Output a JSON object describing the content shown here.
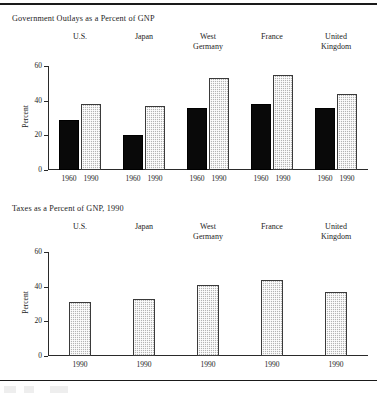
{
  "document": {
    "has_top_rule": true,
    "has_bottom_rule": true
  },
  "charts": [
    {
      "id": "government-outlays",
      "title": "Government Outlays as a Percent of GNP",
      "ylabel": "Percent",
      "yticks": [
        "60",
        "40",
        "20",
        "0"
      ],
      "groups": [
        "U.S.",
        "Japan",
        "West\nGermany",
        "France",
        "United\nKingdom"
      ],
      "xlabels": [
        "1960",
        "1990",
        "1960",
        "1990",
        "1960",
        "1990",
        "1960",
        "1990",
        "1960",
        "1990"
      ]
    },
    {
      "id": "taxes",
      "title": "Taxes as a Percent of GNP, 1990",
      "ylabel": "Percent",
      "yticks": [
        "60",
        "40",
        "20",
        "0"
      ],
      "groups": [
        "U.S.",
        "Japan",
        "West\nGermany",
        "France",
        "United\nKingdom"
      ],
      "xlabels": [
        "1990",
        "1990",
        "1990",
        "1990",
        "1990"
      ]
    }
  ],
  "chart_data": [
    {
      "type": "bar",
      "title": "Government Outlays as a Percent of GNP",
      "xlabel": "",
      "ylabel": "Percent",
      "ylim": [
        0,
        60
      ],
      "yticks": [
        0,
        20,
        40,
        60
      ],
      "grid": false,
      "legend": "none",
      "categories": [
        "U.S.",
        "Japan",
        "West Germany",
        "France",
        "United Kingdom"
      ],
      "series": [
        {
          "name": "1960",
          "fill": "solid-black",
          "color": "#090909",
          "values": [
            29,
            20,
            36,
            38,
            36
          ]
        },
        {
          "name": "1990",
          "fill": "gray-stipple",
          "color": "#b4b4b4",
          "values": [
            38,
            37,
            53,
            55,
            44
          ]
        }
      ]
    },
    {
      "type": "bar",
      "title": "Taxes as a Percent of GNP, 1990",
      "xlabel": "",
      "ylabel": "Percent",
      "ylim": [
        0,
        60
      ],
      "yticks": [
        0,
        20,
        40,
        60
      ],
      "grid": false,
      "legend": "none",
      "categories": [
        "U.S.",
        "Japan",
        "West Germany",
        "France",
        "United Kingdom"
      ],
      "series": [
        {
          "name": "1990",
          "fill": "gray-stipple",
          "color": "#b4b4b4",
          "values": [
            31,
            33,
            41,
            44,
            37
          ]
        }
      ]
    }
  ]
}
